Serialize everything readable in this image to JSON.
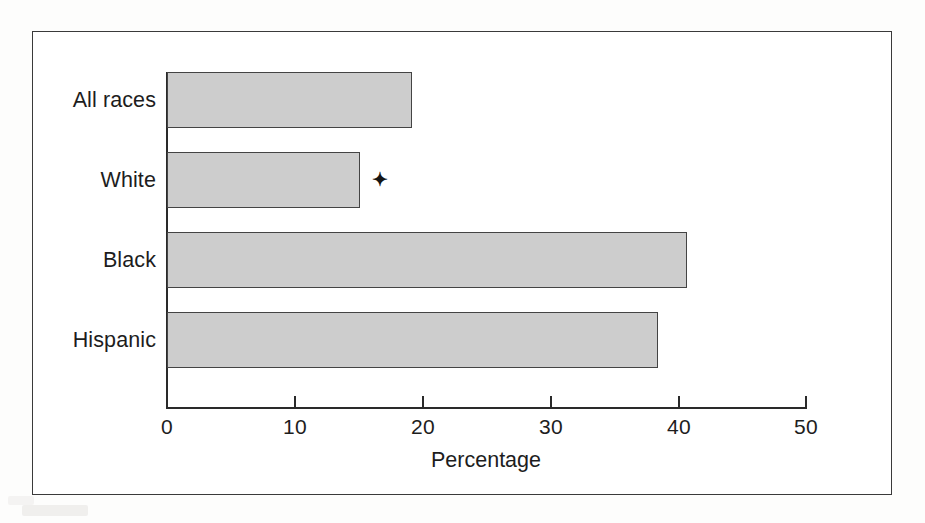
{
  "figure": {
    "background_color": "#ffffff",
    "frame_color": "#3a3a3a",
    "bar_fill_color": "#cdcdcd",
    "bar_edge_color": "#444444",
    "axis_color": "#2a2a2a",
    "marker_symbol": "✦"
  },
  "chart_data": {
    "type": "bar",
    "orientation": "horizontal",
    "title": "",
    "xlabel": "Percentage",
    "ylabel": "",
    "categories": [
      "All races",
      "White",
      "Black",
      "Hispanic"
    ],
    "values": [
      19.2,
      15.1,
      40.7,
      38.4
    ],
    "series": [
      {
        "name": "Percentage",
        "values": [
          19.2,
          15.1,
          40.7,
          38.4
        ]
      }
    ],
    "xlim": [
      0,
      50
    ],
    "xticks": [
      0,
      10,
      20,
      30,
      40,
      50
    ],
    "xtick_labels": [
      "0",
      "10",
      "20",
      "30",
      "40",
      "50"
    ],
    "grid": false,
    "legend": false,
    "legend_position": "none",
    "annotations": [
      {
        "text": "✦",
        "category": "White",
        "x_value": 16.5,
        "note": "footnote marker placed to the right of the White bar"
      }
    ]
  }
}
